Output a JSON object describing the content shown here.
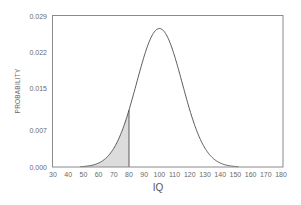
{
  "chart_data": {
    "type": "area",
    "title": "",
    "xlabel": "IQ",
    "ylabel": "PROBABILITY",
    "distribution": {
      "name": "normal",
      "mean": 100,
      "sd": 15
    },
    "xlim": [
      30,
      180
    ],
    "ylim": [
      0,
      0.029
    ],
    "x_ticks": [
      30,
      40,
      50,
      60,
      70,
      80,
      90,
      100,
      110,
      120,
      130,
      140,
      150,
      160,
      170,
      180
    ],
    "y_ticks": [
      "0.000",
      "0.007",
      "0.015",
      "0.022",
      "0.029"
    ],
    "y_tick_values": [
      0.0,
      0.007,
      0.015,
      0.022,
      0.029
    ],
    "shaded_region": {
      "from": 30,
      "to": 80,
      "fill": "#dcdcdc"
    },
    "series": [
      {
        "name": "IQ density",
        "x": [
          30,
          40,
          50,
          60,
          70,
          80,
          90,
          100,
          110,
          120,
          130,
          140,
          150,
          160,
          170,
          180
        ],
        "values": [
          0.0,
          0.0,
          0.0001,
          0.0007,
          0.0036,
          0.0109,
          0.0213,
          0.0266,
          0.0213,
          0.0109,
          0.0036,
          0.0007,
          0.0001,
          0.0,
          0.0,
          0.0
        ]
      }
    ],
    "grid": false,
    "legend": null
  },
  "colors": {
    "axis": "#8a8a8a",
    "curve": "#4a4a4a",
    "shade": "#dcdcdc",
    "text": "#6a6a6a"
  }
}
